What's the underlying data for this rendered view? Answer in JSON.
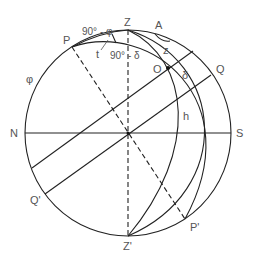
{
  "diagram": {
    "labels": {
      "zenith": "Z",
      "nadir": "Z'",
      "north": "N",
      "south": "S",
      "pole": "P",
      "pole_opposite": "P'",
      "equator_east": "Q",
      "equator_west": "Q'",
      "object": "O",
      "azimuth": "A",
      "zenith_distance": "z",
      "declination": "δ",
      "altitude": "h",
      "hour_angle": "t",
      "latitude": "φ",
      "colatitude": "90° - φ",
      "codeclination": "90° - δ"
    },
    "colors": {
      "line": "#222222",
      "text": "#555555",
      "background": "#ffffff"
    }
  }
}
